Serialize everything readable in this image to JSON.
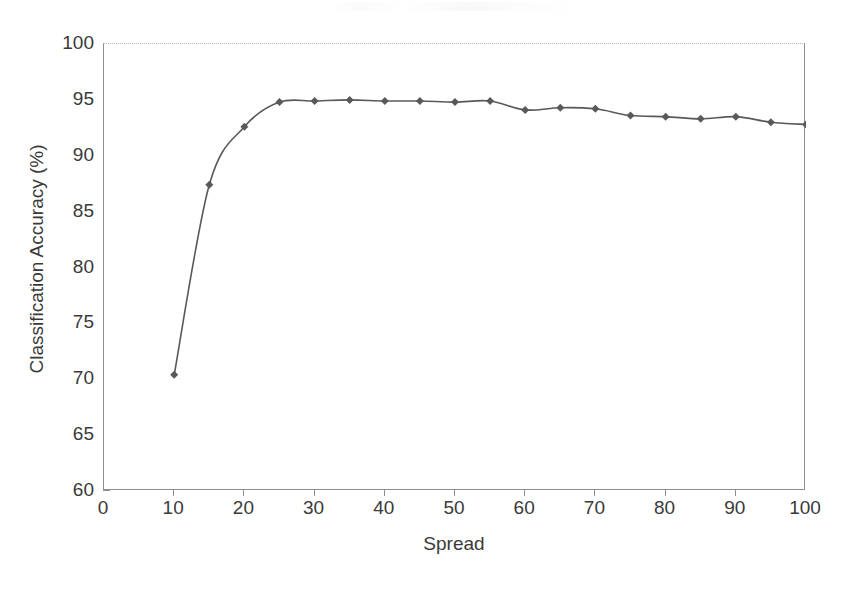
{
  "chart_data": {
    "type": "line",
    "title": "",
    "xlabel": "Spread",
    "ylabel": "Classification Accuracy (%)",
    "xlim": [
      0,
      100
    ],
    "ylim": [
      60,
      100
    ],
    "xticks": [
      0,
      10,
      20,
      30,
      40,
      50,
      60,
      70,
      80,
      90,
      100
    ],
    "yticks": [
      60,
      65,
      70,
      75,
      80,
      85,
      90,
      95,
      100
    ],
    "grid": false,
    "legend": null,
    "marker": "diamond",
    "series_color": "#595959",
    "x": [
      10,
      15,
      20,
      25,
      30,
      35,
      40,
      45,
      50,
      55,
      60,
      65,
      70,
      75,
      80,
      85,
      90,
      95,
      100
    ],
    "values": [
      70.4,
      87.4,
      92.6,
      94.8,
      94.9,
      95.0,
      94.9,
      94.9,
      94.8,
      94.9,
      94.1,
      94.3,
      94.2,
      93.6,
      93.5,
      93.3,
      93.5,
      93.0,
      92.8
    ],
    "series": [
      {
        "name": "Classification Accuracy",
        "values": [
          70.4,
          87.4,
          92.6,
          94.8,
          94.9,
          95.0,
          94.9,
          94.9,
          94.8,
          94.9,
          94.1,
          94.3,
          94.2,
          93.6,
          93.5,
          93.3,
          93.5,
          93.0,
          92.8
        ]
      }
    ]
  },
  "axis": {
    "x_title": "Spread",
    "y_title": "Classification Accuracy (%)",
    "x_tick_labels": [
      "0",
      "10",
      "20",
      "30",
      "40",
      "50",
      "60",
      "70",
      "80",
      "90",
      "100"
    ],
    "y_tick_labels": [
      "100",
      "95",
      "90",
      "85",
      "80",
      "75",
      "70",
      "65",
      "60"
    ]
  },
  "colors": {
    "series": "#595959",
    "axis": "#8f8f8f",
    "text": "#3a3a3a",
    "background": "#ffffff"
  }
}
